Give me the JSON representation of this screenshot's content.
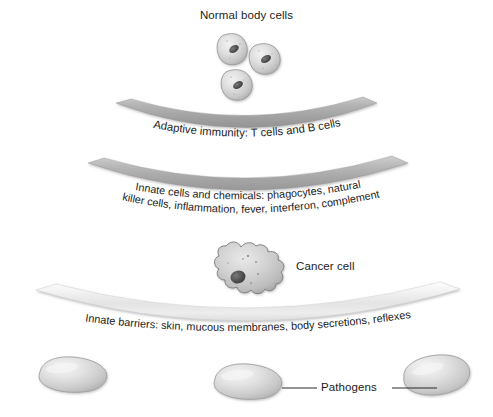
{
  "figure": {
    "type": "biology-diagram",
    "background_color": "#ffffff"
  },
  "labels": {
    "normal_body_cells": "Normal body cells",
    "cancer_cell": "Cancer cell",
    "pathogens": "Pathogens"
  },
  "bands": [
    {
      "id": "adaptive-immunity",
      "text": "Adaptive immunity: T cells and B cells",
      "lines": [
        "Adaptive immunity: T cells and B cells"
      ],
      "tone": "medium-gray",
      "color": "#a9a9a9"
    },
    {
      "id": "innate-cells-and-chemicals",
      "text": "Innate cells and chemicals: phagocytes, natural killer cells, inflammation, fever, interferon, complement",
      "lines": [
        "Innate cells and chemicals: phagocytes, natural",
        "killer cells, inflammation, fever, interferon, complement"
      ],
      "tone": "medium-gray",
      "color": "#a9a9a9"
    },
    {
      "id": "innate-barriers",
      "text": "Innate barriers: skin, mucous membranes, body secretions, reflexes",
      "lines": [
        "Innate barriers: skin, mucous membranes, body secretions, reflexes"
      ],
      "tone": "light-gray",
      "color": "#e6e6e6"
    }
  ],
  "cells": {
    "normal_body_cells_count": 3,
    "cancer_cells_count": 1,
    "pathogens_count": 3
  },
  "colors": {
    "band_dark": "#9a9a9a",
    "band_mid": "#b4b4b4",
    "band_light": "#ededed",
    "cell_fill": "#d8d8d8",
    "cell_outline": "#6f6f6f",
    "nucleus": "#4a4a4a",
    "text": "#1c1c1c",
    "leader_line": "#2a2a2a"
  }
}
